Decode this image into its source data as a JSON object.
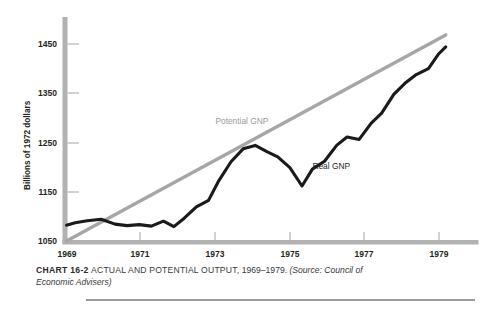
{
  "chart_data": {
    "type": "line",
    "title": "ACTUAL AND POTENTIAL OUTPUT, 1969–1979.",
    "chart_number": "CHART 16-2",
    "source": "(Source: Council of Economic Advisers)",
    "xlabel": "",
    "ylabel": "Billions of 1972 dollars",
    "xlim": [
      1969,
      1979.9
    ],
    "ylim": [
      1050,
      1490
    ],
    "grid": false,
    "legend_position": "inline-annotations",
    "xticks": [
      "1969",
      "1971",
      "1973",
      "1975",
      "1977",
      "1979"
    ],
    "xtick_values": [
      1969,
      1971,
      1973,
      1975,
      1977,
      1979
    ],
    "yticks": [
      "1050",
      "1150",
      "1250",
      "1350",
      "1450"
    ],
    "ytick_values": [
      1050,
      1150,
      1250,
      1350,
      1450
    ],
    "series": [
      {
        "name": "Potential GNP",
        "color": "#a6a6a6",
        "label_x": 1973.3,
        "label_y": 1288,
        "x": [
          1969.0,
          1979.95
        ],
        "values": [
          1052,
          1468
        ]
      },
      {
        "name": "Real GNP",
        "color": "#1a1a1a",
        "label_x": 1976.1,
        "label_y": 1198,
        "x": [
          1969.0,
          1969.25,
          1969.6,
          1970.0,
          1970.4,
          1970.75,
          1971.1,
          1971.45,
          1971.8,
          1972.1,
          1972.4,
          1972.75,
          1973.1,
          1973.4,
          1973.75,
          1974.1,
          1974.45,
          1974.8,
          1975.1,
          1975.45,
          1975.8,
          1976.1,
          1976.45,
          1976.8,
          1977.1,
          1977.45,
          1977.8,
          1978.1,
          1978.45,
          1978.8,
          1979.1,
          1979.45,
          1979.75,
          1979.95
        ],
        "values": [
          1084,
          1089,
          1093,
          1096,
          1086,
          1083,
          1085,
          1082,
          1092,
          1081,
          1098,
          1121,
          1134,
          1174,
          1212,
          1238,
          1245,
          1232,
          1222,
          1200,
          1163,
          1197,
          1213,
          1245,
          1262,
          1257,
          1290,
          1310,
          1348,
          1372,
          1388,
          1400,
          1430,
          1444
        ]
      }
    ]
  },
  "caption": {
    "chart_number": "CHART 16-2",
    "title": "ACTUAL AND POTENTIAL OUTPUT,",
    "years": "1969–1979",
    "source": "(Source: Council of Economic Advisers)"
  },
  "colors": {
    "potential_gnp": "#a6a6a6",
    "real_gnp": "#1a1a1a",
    "axis": "#b0b0b0",
    "text": "#231f20"
  }
}
